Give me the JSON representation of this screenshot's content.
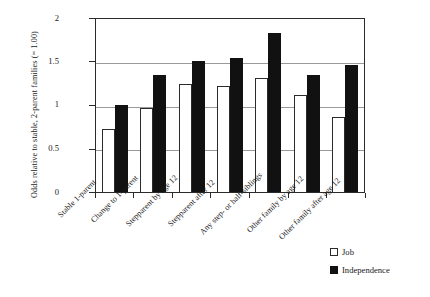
{
  "chart_data": {
    "type": "bar",
    "title": "",
    "xlabel": "",
    "ylabel": "Odds relative to stable, 2-parent families (= 1.00)",
    "ylim": [
      0,
      2
    ],
    "yticks": [
      "0",
      "0.5",
      "1",
      "1.5",
      "2"
    ],
    "grid": true,
    "legend_position": "bottom-right",
    "categories": [
      "Stable 1-parent",
      "Change  to 1-parent",
      "Stepparent by age 12",
      "Stepparent after 12",
      "Any step- or half-siblings",
      "Other family by age 12",
      "Other family after age 12"
    ],
    "series": [
      {
        "name": "Job",
        "color": "#ffffff",
        "values": [
          0.72,
          0.96,
          1.24,
          1.21,
          1.3,
          1.11,
          0.86
        ]
      },
      {
        "name": "Independence",
        "color": "#111111",
        "values": [
          0.99,
          1.34,
          1.5,
          1.53,
          1.82,
          1.34,
          1.45
        ]
      }
    ]
  },
  "legend": {
    "items": [
      {
        "label": "Job",
        "swatch": "white-square-icon"
      },
      {
        "label": "Independence",
        "swatch": "black-square-icon"
      }
    ]
  }
}
